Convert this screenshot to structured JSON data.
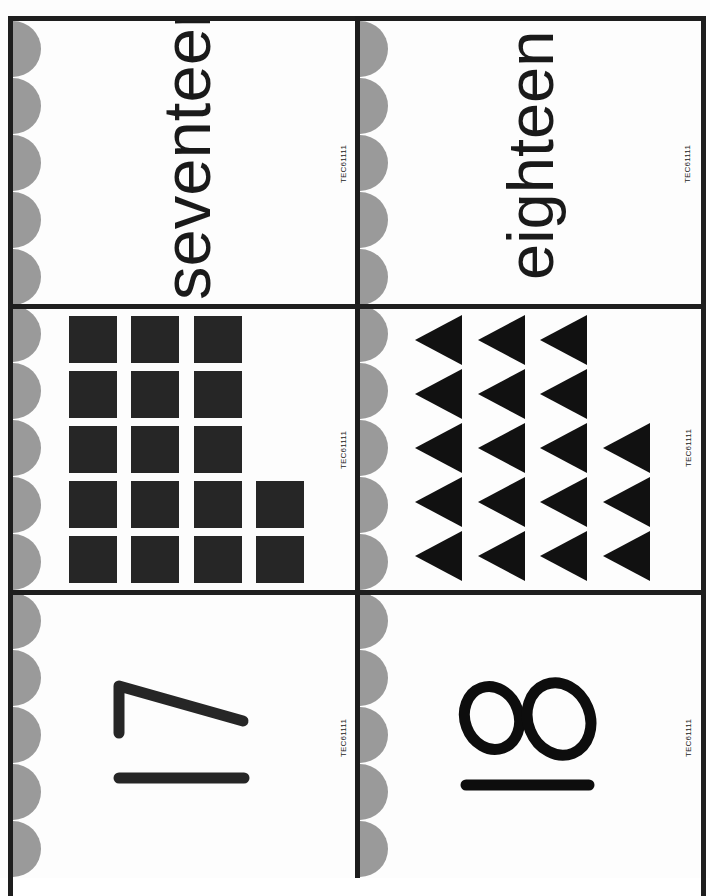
{
  "page": {
    "colors": {
      "border": "#1e1e1e",
      "scallop": "#9a9a9a",
      "shape_fill": "#262626",
      "background": "#ffffff"
    }
  },
  "cards": [
    {
      "id": "word-17",
      "type": "word",
      "text": "seventeen",
      "code": "TEC61111"
    },
    {
      "id": "word-18",
      "type": "word",
      "text": "eighteen",
      "code": "TEC61111"
    },
    {
      "id": "squares-17",
      "type": "set",
      "shape": "square",
      "count": 17,
      "columns": [
        5,
        5,
        5,
        2
      ],
      "code": "TEC61111"
    },
    {
      "id": "triangles-18",
      "type": "set",
      "shape": "triangle-left",
      "count": 18,
      "columns": [
        5,
        5,
        5,
        3
      ],
      "code": "TEC61111"
    },
    {
      "id": "numeral-17",
      "type": "numeral",
      "value": "17",
      "code": "TEC61111"
    },
    {
      "id": "numeral-18",
      "type": "numeral",
      "value": "18",
      "code": "TEC61111"
    }
  ],
  "layout": {
    "rows": 3,
    "cols": 2,
    "orientation": "rotated -90deg",
    "scallops_per_card": 5
  }
}
